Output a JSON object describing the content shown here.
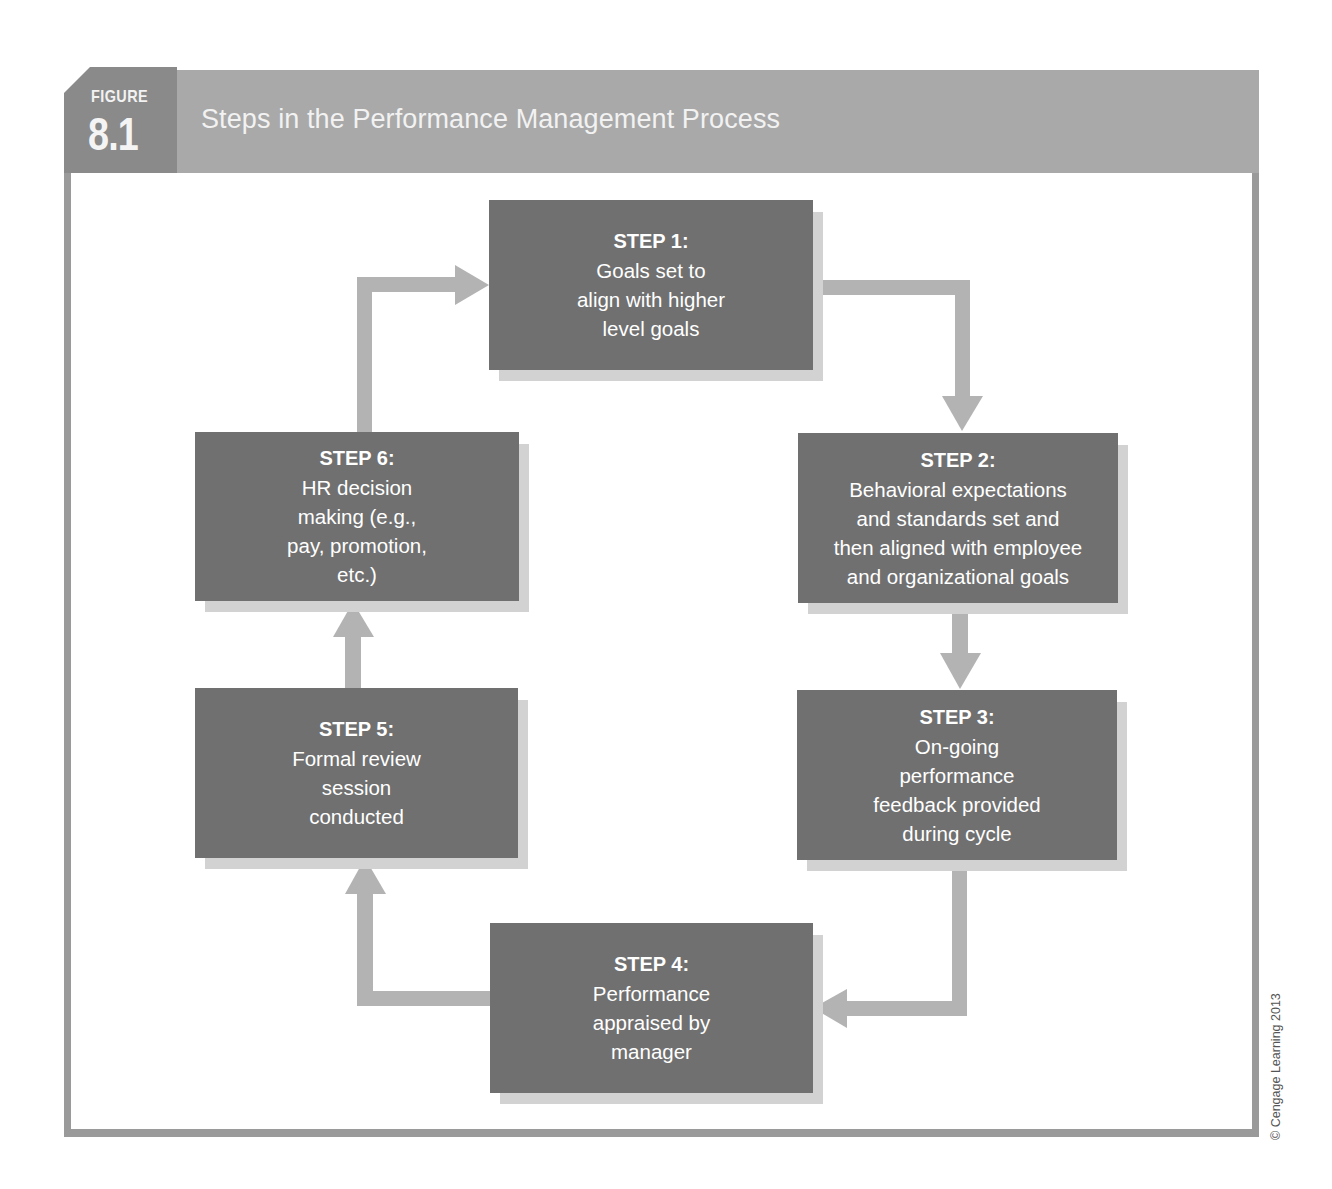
{
  "figure": {
    "label": "FIGURE",
    "number": "8.1",
    "title": "Steps in the Performance Management Process"
  },
  "colors": {
    "header": "#a9a9a9",
    "badge": "#8a8a8a",
    "box": "#707070",
    "box_shadow": "#d2d2d2",
    "arrow": "#b3b3b3",
    "frame": "#9a9a9a",
    "text": "#ffffff"
  },
  "steps": [
    {
      "title": "STEP 1:",
      "text": "Goals set to\nalign with higher\nlevel goals"
    },
    {
      "title": "STEP 2:",
      "text": "Behavioral expectations\nand standards set and\nthen aligned with employee\nand organizational goals"
    },
    {
      "title": "STEP 3:",
      "text": "On-going\nperformance\nfeedback provided\nduring cycle"
    },
    {
      "title": "STEP 4:",
      "text": "Performance\nappraised by\nmanager"
    },
    {
      "title": "STEP 5:",
      "text": "Formal review\nsession\nconducted"
    },
    {
      "title": "STEP 6:",
      "text": "HR decision\nmaking (e.g.,\npay, promotion,\netc.)"
    }
  ],
  "flow": [
    {
      "from": "STEP 1",
      "to": "STEP 2"
    },
    {
      "from": "STEP 2",
      "to": "STEP 3"
    },
    {
      "from": "STEP 3",
      "to": "STEP 4"
    },
    {
      "from": "STEP 4",
      "to": "STEP 5"
    },
    {
      "from": "STEP 5",
      "to": "STEP 6"
    },
    {
      "from": "STEP 6",
      "to": "STEP 1"
    }
  ],
  "copyright": "© Cengage Learning 2013"
}
